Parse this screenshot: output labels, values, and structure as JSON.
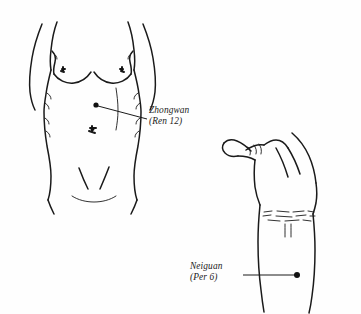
{
  "figure": {
    "background_color": "#fefefe",
    "ink_color": "#1a1a1a",
    "style": "black-and-white line drawing"
  },
  "annotations": [
    {
      "id": "zhongwan",
      "name_line": "Zhongwan",
      "code_line": "(Ren 12)",
      "body_region": "abdomen-upper-midline",
      "marker": {
        "x": 96,
        "y": 105,
        "radius": 2.6,
        "color": "#111111"
      },
      "leader": {
        "x1": 97,
        "y1": 106,
        "x2": 147,
        "y2": 119
      }
    },
    {
      "id": "neiguan",
      "name_line": "Neiguan",
      "code_line": "(Per 6)",
      "body_region": "inner-forearm-wrist",
      "marker": {
        "x": 297,
        "y": 275,
        "radius": 3.0,
        "color": "#111111"
      },
      "leader": {
        "x1": 243,
        "y1": 275,
        "x2": 295,
        "y2": 275
      }
    }
  ],
  "illustrations": [
    {
      "id": "torso",
      "label": "female-torso-front-view",
      "features": [
        "left-arm",
        "right-arm",
        "left-breast",
        "right-breast",
        "navel",
        "inguinal-creases",
        "waist-contour"
      ]
    },
    {
      "id": "hand",
      "label": "hand-and-wrist-closed-fist",
      "features": [
        "thumb",
        "knuckle-creases",
        "palm-contour",
        "wrist-creases",
        "forearm-tendons",
        "forearm"
      ]
    }
  ]
}
